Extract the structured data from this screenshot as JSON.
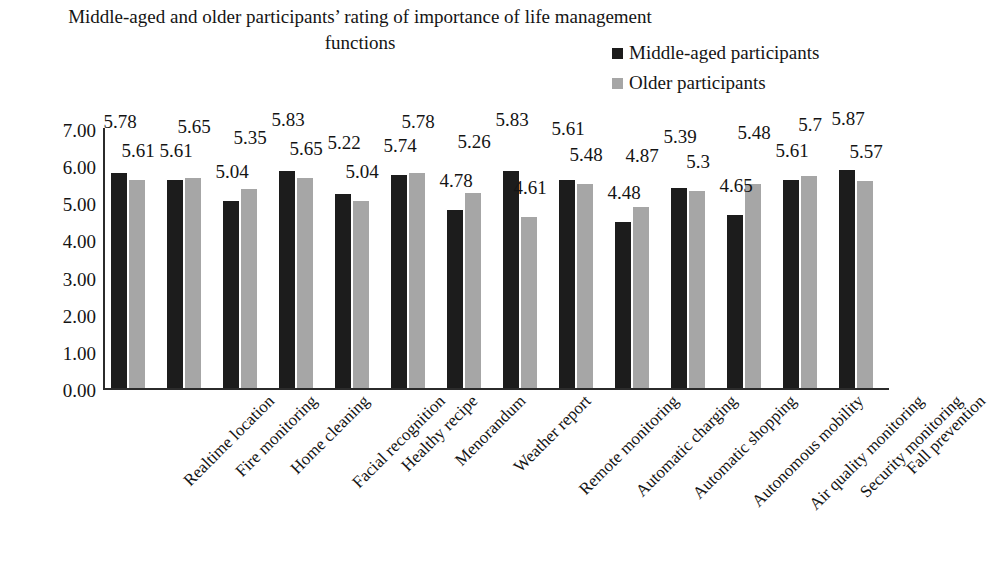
{
  "chart_data": {
    "type": "bar",
    "title": "Middle-aged and older participants’ rating of importance of life management functions",
    "xlabel": "",
    "ylabel": "",
    "ylim": [
      0,
      7
    ],
    "ytick_labels": [
      "7.00",
      "6.00",
      "5.00",
      "4.00",
      "3.00",
      "2.00",
      "1.00",
      "0.00"
    ],
    "ytick_values": [
      7,
      6,
      5,
      4,
      3,
      2,
      1,
      0
    ],
    "grid": false,
    "legend_position": "top-right",
    "categories": [
      "Realtime location",
      "Fire monitoring",
      "Home cleaning",
      "Facial recognition",
      "Healthy recipe",
      "Menorandum",
      "Weather report",
      "Remote monitoring",
      "Automatic charging",
      "Automatic shopping",
      "Autonomous mobility",
      "Air quality monitoring",
      "Security monitoring",
      "Fall prevention"
    ],
    "series": [
      {
        "name": "Middle-aged participants",
        "color": "#1c1c1c",
        "values": [
          5.78,
          5.61,
          5.04,
          5.83,
          5.22,
          5.74,
          4.78,
          5.83,
          5.61,
          4.48,
          5.39,
          4.65,
          5.61,
          5.87
        ],
        "labels": [
          "5.78",
          "5.61",
          "5.04",
          "5.83",
          "5.22",
          "5.74",
          "4.78",
          "5.83",
          "5.61",
          "4.48",
          "5.39",
          "4.65",
          "5.61",
          "5.87"
        ]
      },
      {
        "name": "Older participants",
        "color": "#a6a6a6",
        "values": [
          5.61,
          5.65,
          5.35,
          5.65,
          5.04,
          5.78,
          5.26,
          4.61,
          5.48,
          4.87,
          5.3,
          5.48,
          5.7,
          5.57
        ],
        "labels": [
          "5.61",
          "5.65",
          "5.35",
          "5.65",
          "5.04",
          "5.78",
          "5.26",
          "4.61",
          "5.48",
          "4.87",
          "5.3",
          "5.48",
          "5.7",
          "5.57"
        ]
      }
    ]
  },
  "legend": {
    "items": [
      {
        "label": "Middle-aged participants",
        "color": "#1c1c1c"
      },
      {
        "label": "Older participants",
        "color": "#a6a6a6"
      }
    ]
  }
}
